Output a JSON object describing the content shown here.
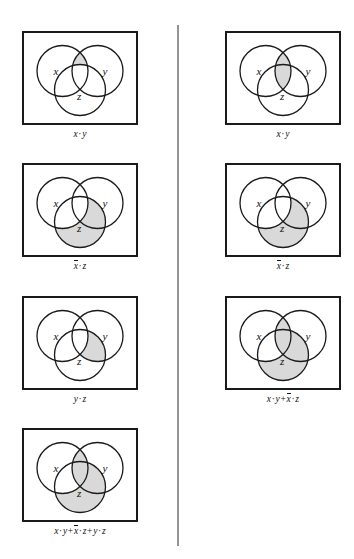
{
  "figure": {
    "shade_color": "#d9d9d9",
    "stroke_color": "#1a1a1a",
    "box_border_color": "#1a1a1a",
    "divider_color": "#949494",
    "background": "#ffffff",
    "circle_labels": {
      "x": "x",
      "y": "y",
      "z": "z"
    }
  },
  "panels": [
    {
      "id": "panel-left-1",
      "column": "left",
      "row": 1,
      "caption_parts": [
        {
          "text": "x",
          "bar": false
        },
        {
          "text": "·",
          "op": true
        },
        {
          "text": "y",
          "bar": false
        }
      ],
      "caption_text": "x · y",
      "regions": [
        "xy-not-z"
      ]
    },
    {
      "id": "panel-right-1",
      "column": "right",
      "row": 1,
      "caption_parts": [
        {
          "text": "x",
          "bar": false
        },
        {
          "text": "·",
          "op": true
        },
        {
          "text": "y",
          "bar": false
        }
      ],
      "caption_text": "x · y",
      "regions": [
        "xy-all"
      ]
    },
    {
      "id": "panel-left-2",
      "column": "left",
      "row": 2,
      "caption_parts": [
        {
          "text": "x",
          "bar": true
        },
        {
          "text": "·",
          "op": true
        },
        {
          "text": "z",
          "bar": false
        }
      ],
      "caption_text": "x̄ · z",
      "regions": [
        "z-not-x"
      ]
    },
    {
      "id": "panel-right-2",
      "column": "right",
      "row": 2,
      "caption_parts": [
        {
          "text": "x",
          "bar": true
        },
        {
          "text": "·",
          "op": true
        },
        {
          "text": "z",
          "bar": false
        }
      ],
      "caption_text": "x̄ · z",
      "regions": [
        "z-not-x"
      ]
    },
    {
      "id": "panel-left-3",
      "column": "left",
      "row": 3,
      "caption_parts": [
        {
          "text": "y",
          "bar": false
        },
        {
          "text": "·",
          "op": true
        },
        {
          "text": "z",
          "bar": false
        }
      ],
      "caption_text": "y · z",
      "regions": [
        "yz-not-x"
      ]
    },
    {
      "id": "panel-right-3",
      "column": "right",
      "row": 3,
      "caption_parts": [
        {
          "text": "x",
          "bar": false
        },
        {
          "text": "·",
          "op": true
        },
        {
          "text": "y",
          "bar": false
        },
        {
          "text": "+",
          "op": true
        },
        {
          "text": "x",
          "bar": true
        },
        {
          "text": "·",
          "op": true
        },
        {
          "text": "z",
          "bar": false
        }
      ],
      "caption_text": "x · y + x̄ · z",
      "regions": [
        "xy-all",
        "z-not-x"
      ]
    },
    {
      "id": "panel-left-4",
      "column": "left",
      "row": 4,
      "caption_parts": [
        {
          "text": "x",
          "bar": false
        },
        {
          "text": "·",
          "op": true
        },
        {
          "text": "y",
          "bar": false
        },
        {
          "text": "+",
          "op": true
        },
        {
          "text": "x",
          "bar": true
        },
        {
          "text": "·",
          "op": true
        },
        {
          "text": "z",
          "bar": false
        },
        {
          "text": "+",
          "op": true
        },
        {
          "text": "y",
          "bar": false
        },
        {
          "text": "·",
          "op": true
        },
        {
          "text": "z",
          "bar": false
        }
      ],
      "caption_text": "x · y + x̄ · z + y · z",
      "regions": [
        "xy-all",
        "z-not-x",
        "yz-not-x"
      ]
    }
  ]
}
